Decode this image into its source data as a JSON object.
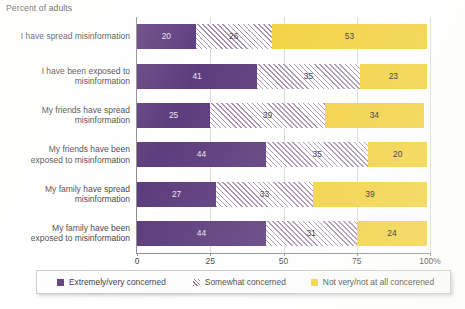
{
  "chart_data": {
    "type": "bar",
    "orientation": "horizontal",
    "stacked": true,
    "stack_total": 100,
    "title": "Percent of adults",
    "xlabel": "",
    "ylabel": "",
    "xlim": [
      0,
      100
    ],
    "grid": true,
    "legend_position": "bottom",
    "categories": [
      "I have spread misinformation",
      "I have been exposed to misinformation",
      "My friends have spread misinformation",
      "My friends have been exposed to misinformation",
      "My family have spread misinformation",
      "My family have been exposed to misinformation"
    ],
    "category_lines": [
      [
        "I have spread misinformation"
      ],
      [
        "I have been exposed to",
        "misinformation"
      ],
      [
        "My friends have spread",
        "misinformation"
      ],
      [
        "My friends have been",
        "exposed to misinformation"
      ],
      [
        "My family have spread",
        "misinformation"
      ],
      [
        "My family have been",
        "exposed to misinformation"
      ]
    ],
    "series": [
      {
        "name": "Extremely/very concerned",
        "color": "#5d3d7d",
        "values": [
          20,
          41,
          25,
          44,
          27,
          44
        ]
      },
      {
        "name": "Somewhat concerned",
        "color": "#a98fb4",
        "values": [
          26,
          35,
          39,
          35,
          33,
          31
        ]
      },
      {
        "name": "Not very/not at all concerened",
        "color": "#f3d23f",
        "values": [
          53,
          23,
          34,
          20,
          39,
          24
        ]
      }
    ],
    "xticks": [
      0,
      25,
      50,
      75,
      100
    ],
    "xtick_labels": [
      "0",
      "25",
      "50",
      "75",
      "100%"
    ]
  },
  "legend": {
    "items": [
      {
        "label": "Extremely/very concerned"
      },
      {
        "label": "Somewhat concerned"
      },
      {
        "label": "Not very/not at all concerened"
      }
    ]
  },
  "colors": {
    "series_1": "#5d3d7d",
    "series_2": "#a98fb4",
    "series_3": "#f3d23f",
    "axis": "#8e8e8e",
    "grid": "#d9d9d9",
    "text": "#3f3f3f",
    "background": "#ffffff"
  }
}
